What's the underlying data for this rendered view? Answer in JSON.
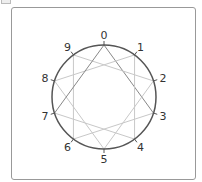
{
  "diagram": {
    "type": "modular-circle",
    "points": [
      "0",
      "1",
      "2",
      "3",
      "4",
      "5",
      "6",
      "7",
      "8",
      "9"
    ],
    "step": 3,
    "edges": [
      [
        0,
        3
      ],
      [
        3,
        6
      ],
      [
        6,
        9
      ],
      [
        9,
        2
      ],
      [
        2,
        5
      ],
      [
        5,
        8
      ],
      [
        8,
        1
      ],
      [
        1,
        4
      ],
      [
        4,
        7
      ],
      [
        7,
        0
      ]
    ],
    "highlight_edges": [
      [
        0,
        3
      ],
      [
        0,
        7
      ]
    ],
    "colors": {
      "circle": "#555555",
      "edge": "#c8c8c8",
      "highlight": "#888888",
      "label": "#333333"
    }
  }
}
